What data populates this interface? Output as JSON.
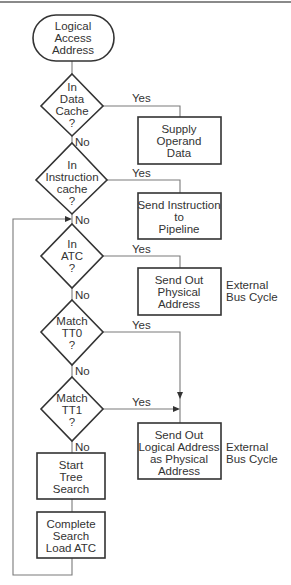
{
  "diagram": {
    "type": "flowchart",
    "start": {
      "label": [
        "Logical",
        "Access",
        "Address"
      ]
    },
    "decisions": [
      {
        "id": "d1",
        "label": [
          "In",
          "Data",
          "Cache",
          "?"
        ],
        "yes": "Yes",
        "no": "No"
      },
      {
        "id": "d2",
        "label": [
          "In",
          "Instruction",
          "cache",
          "?"
        ],
        "yes": "Yes",
        "no": "No"
      },
      {
        "id": "d3",
        "label": [
          "In",
          "ATC",
          "?"
        ],
        "yes": "Yes",
        "no": "No"
      },
      {
        "id": "d4",
        "label": [
          "Match",
          "TT0",
          "?"
        ],
        "yes": "Yes",
        "no": "No"
      },
      {
        "id": "d5",
        "label": [
          "Match",
          "TT1",
          "?"
        ],
        "yes": "Yes",
        "no": "No"
      }
    ],
    "processes": [
      {
        "id": "p1",
        "label": [
          "Supply",
          "Operand",
          "Data"
        ]
      },
      {
        "id": "p2",
        "label": [
          "Send Instruction",
          "to",
          "Pipeline"
        ]
      },
      {
        "id": "p3",
        "label": [
          "Send Out",
          "Physical",
          "Address"
        ],
        "note": [
          "External",
          "Bus Cycle"
        ]
      },
      {
        "id": "p4",
        "label": [
          "Send Out",
          "Logical Address",
          "as Physical",
          "Address"
        ],
        "note": [
          "External",
          "Bus Cycle"
        ]
      },
      {
        "id": "p5",
        "label": [
          "Start",
          "Tree",
          "Search"
        ]
      },
      {
        "id": "p6",
        "label": [
          "Complete",
          "Search",
          "Load ATC"
        ]
      }
    ]
  }
}
